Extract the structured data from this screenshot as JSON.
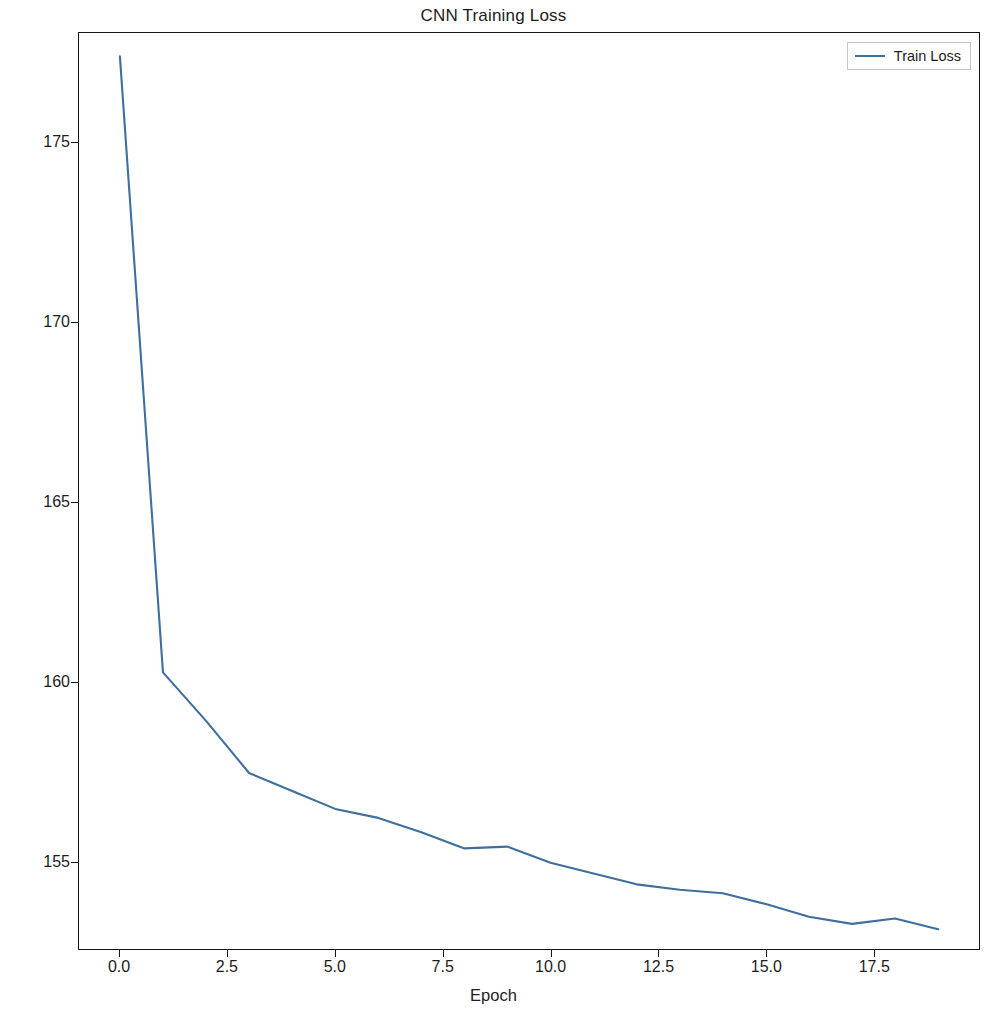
{
  "chart_data": {
    "type": "line",
    "title": "CNN Training Loss",
    "xlabel": "Epoch",
    "ylabel": "Loss",
    "grid": false,
    "legend_position": "upper right",
    "line_color": "#3f6f9f",
    "xlim": [
      -0.95,
      19.95
    ],
    "ylim": [
      152.55,
      178.05
    ],
    "xticks": [
      0.0,
      2.5,
      5.0,
      7.5,
      10.0,
      12.5,
      15.0,
      17.5
    ],
    "xtick_labels": [
      "0.0",
      "2.5",
      "5.0",
      "7.5",
      "10.0",
      "12.5",
      "15.0",
      "17.5"
    ],
    "yticks": [
      155,
      160,
      165,
      170,
      175
    ],
    "ytick_labels": [
      "155",
      "160",
      "165",
      "170",
      "175"
    ],
    "series": [
      {
        "name": "Train Loss",
        "x": [
          0,
          1,
          2,
          3,
          4,
          5,
          6,
          7,
          8,
          9,
          10,
          11,
          12,
          13,
          14,
          15,
          16,
          17,
          18,
          19
        ],
        "values": [
          177.4,
          160.25,
          158.9,
          157.45,
          156.95,
          156.45,
          156.2,
          155.8,
          155.35,
          155.4,
          154.95,
          154.65,
          154.35,
          154.2,
          154.1,
          153.8,
          153.45,
          153.25,
          153.4,
          153.1
        ]
      }
    ]
  },
  "legend": {
    "entries": [
      {
        "label": "Train Loss",
        "color": "#3f6f9f"
      }
    ]
  }
}
